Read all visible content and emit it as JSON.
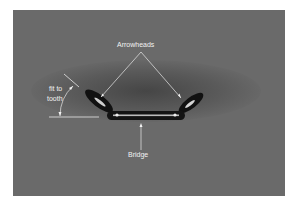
{
  "figure": {
    "background_color": "#6a6a6a",
    "label_color": "#f2f2f2"
  },
  "labels": {
    "arrowheads": "Arrowheads",
    "bridge": "Bridge",
    "fit_line1": "fit to",
    "fit_line2": "tooth"
  }
}
